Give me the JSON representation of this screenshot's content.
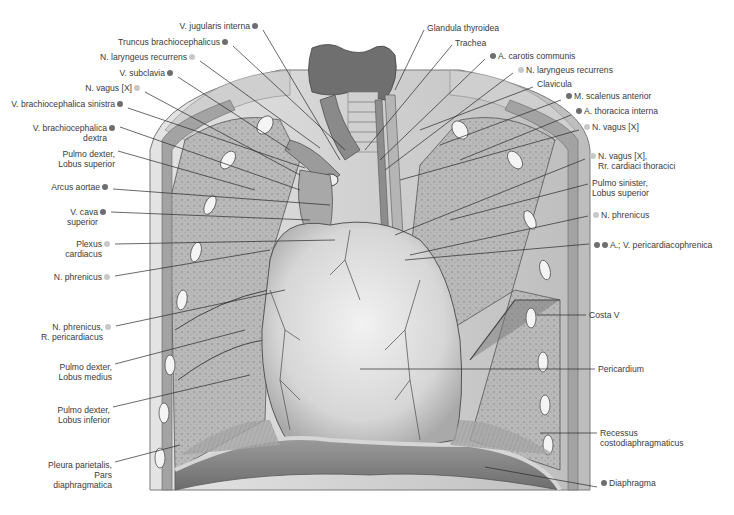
{
  "figure": {
    "colors": {
      "dot_dark": "#6e6e6e",
      "dot_light": "#c8c8c8",
      "text": "#3a3a3a",
      "leader": "#2a2a2a"
    }
  },
  "labels_left": [
    {
      "id": "v-jugularis-interna",
      "lines": [
        "V. jugularis interna"
      ],
      "dots": [
        "dark"
      ],
      "x": 260,
      "y": 26
    },
    {
      "id": "truncus-brachiocephalicus",
      "lines": [
        "Truncus brachiocephalicus"
      ],
      "dots": [
        "dark"
      ],
      "x": 230,
      "y": 42
    },
    {
      "id": "n-laryngeus-recurrens-l",
      "lines": [
        "N. laryngeus recurrens"
      ],
      "dots": [
        "light"
      ],
      "x": 197,
      "y": 57
    },
    {
      "id": "v-subclavia",
      "lines": [
        "V. subclavia"
      ],
      "dots": [
        "dark"
      ],
      "x": 175,
      "y": 73
    },
    {
      "id": "n-vagus-l",
      "lines": [
        "N. vagus [X]"
      ],
      "dots": [
        "light"
      ],
      "x": 142,
      "y": 88
    },
    {
      "id": "v-brachiocephalica-sinistra",
      "lines": [
        "V. brachiocephalica sinistra"
      ],
      "dots": [
        "dark"
      ],
      "x": 125,
      "y": 104
    },
    {
      "id": "v-brachiocephalica-dextra",
      "lines": [
        "V. brachiocephalica",
        "dextra"
      ],
      "dots": [
        "dark"
      ],
      "x": 117,
      "y": 123
    },
    {
      "id": "pulmo-dexter-lobus-superior",
      "lines": [
        "Pulmo dexter,",
        "Lobus superior"
      ],
      "dots": [],
      "x": 115,
      "y": 147
    },
    {
      "id": "arcus-aortae",
      "lines": [
        "Arcus aortae"
      ],
      "dots": [
        "dark"
      ],
      "x": 110,
      "y": 185
    },
    {
      "id": "v-cava-superior",
      "lines": [
        "V. cava",
        "superior"
      ],
      "dots": [
        "dark"
      ],
      "x": 108,
      "y": 208
    },
    {
      "id": "plexus-cardiacus",
      "lines": [
        "Plexus",
        "cardiacus"
      ],
      "dots": [
        "light"
      ],
      "x": 112,
      "y": 240
    },
    {
      "id": "n-phrenicus-l",
      "lines": [
        "N. phrenicus"
      ],
      "dots": [
        "light"
      ],
      "x": 112,
      "y": 272
    },
    {
      "id": "n-phrenicus-r-pericardiacus",
      "lines": [
        "N. phrenicus,",
        "R. pericardiacus"
      ],
      "dots": [
        "light"
      ],
      "x": 113,
      "y": 322
    },
    {
      "id": "pulmo-dexter-lobus-medius",
      "lines": [
        "Pulmo dexter,",
        "Lobus medius"
      ],
      "dots": [],
      "x": 112,
      "y": 360
    },
    {
      "id": "pulmo-dexter-lobus-inferior",
      "lines": [
        "Pulmo dexter,",
        "Lobus inferior"
      ],
      "dots": [],
      "x": 110,
      "y": 403
    },
    {
      "id": "pleura-parietalis",
      "lines": [
        "Pleura parietalis,",
        "Pars",
        "diaphragmatica"
      ],
      "dots": [],
      "x": 112,
      "y": 458
    }
  ],
  "labels_right": [
    {
      "id": "glandula-thyroidea",
      "lines": [
        "Glandula thyroidea"
      ],
      "dots": [],
      "x": 427,
      "y": 26
    },
    {
      "id": "trachea",
      "lines": [
        "Trachea"
      ],
      "dots": [],
      "x": 455,
      "y": 41
    },
    {
      "id": "a-carotis-communis",
      "lines": [
        "A. carotis communis"
      ],
      "dots": [
        "dark"
      ],
      "x": 488,
      "y": 55
    },
    {
      "id": "n-laryngeus-recurrens-r",
      "lines": [
        "N. laryngeus recurrens"
      ],
      "dots": [
        "light"
      ],
      "x": 516,
      "y": 69
    },
    {
      "id": "clavicula",
      "lines": [
        "Clavicula"
      ],
      "dots": [],
      "x": 536,
      "y": 83
    },
    {
      "id": "m-scalenus-anterior",
      "lines": [
        "M. scalenus anterior"
      ],
      "dots": [
        "dark"
      ],
      "x": 564,
      "y": 96
    },
    {
      "id": "a-thoracica-interna",
      "lines": [
        "A. thoracica interna"
      ],
      "dots": [
        "dark"
      ],
      "x": 574,
      "y": 111
    },
    {
      "id": "n-vagus-r",
      "lines": [
        "N. vagus [X]"
      ],
      "dots": [
        "light"
      ],
      "x": 582,
      "y": 126
    },
    {
      "id": "n-vagus-rr-cardiaci",
      "lines": [
        "N. vagus [X],",
        "Rr. cardiaci thoracici"
      ],
      "dots": [
        "light"
      ],
      "x": 588,
      "y": 155
    },
    {
      "id": "pulmo-sinister-lobus-superior",
      "lines": [
        "Pulmo sinister,",
        "Lobus superior"
      ],
      "dots": [],
      "x": 591,
      "y": 180
    },
    {
      "id": "n-phrenicus-r",
      "lines": [
        "N. phrenicus"
      ],
      "dots": [
        "light"
      ],
      "x": 591,
      "y": 212
    },
    {
      "id": "a-v-pericardiacophrenica",
      "lines": [
        "A.; V. pericardiacophrenica"
      ],
      "dots": [
        "dark",
        "dark"
      ],
      "x": 592,
      "y": 240
    },
    {
      "id": "costa-v",
      "lines": [
        "Costa V"
      ],
      "dots": [],
      "x": 589,
      "y": 311
    },
    {
      "id": "pericardium",
      "lines": [
        "Pericardium"
      ],
      "dots": [],
      "x": 598,
      "y": 365
    },
    {
      "id": "recessus-costodiaphragmaticus",
      "lines": [
        "Recessus",
        "costodiaphragmaticus"
      ],
      "dots": [],
      "x": 600,
      "y": 429
    },
    {
      "id": "diaphragma",
      "lines": [
        "Diaphragma"
      ],
      "dots": [
        "dark"
      ],
      "x": 600,
      "y": 483
    }
  ]
}
